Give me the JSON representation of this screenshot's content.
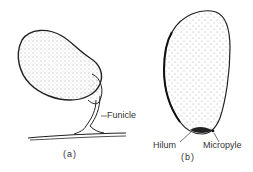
{
  "figure": {
    "panels": [
      {
        "id": "a",
        "caption": "(a)",
        "subject": "ovule attached by funicle to placenta",
        "labels": [
          {
            "text": "Funicle"
          }
        ]
      },
      {
        "id": "b",
        "caption": "(b)",
        "subject": "seed",
        "labels": [
          {
            "text": "Hilum"
          },
          {
            "text": "Micropyle"
          }
        ]
      }
    ]
  }
}
